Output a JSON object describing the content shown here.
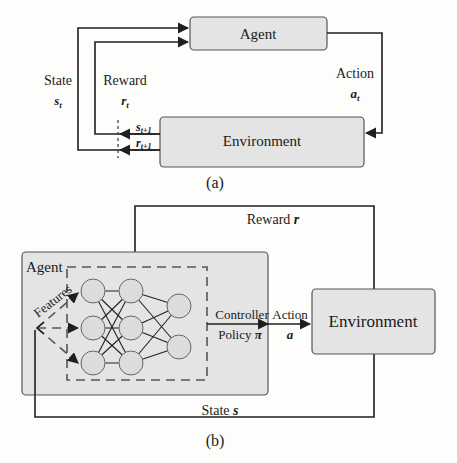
{
  "figure_a": {
    "caption": "(a)",
    "agent_box": {
      "label": "Agent"
    },
    "environment_box": {
      "label": "Environment"
    },
    "state_label": "State",
    "state_symbol": "s",
    "state_sub": "t",
    "reward_label": "Reward",
    "reward_symbol": "r",
    "reward_sub": "t",
    "action_label": "Action",
    "action_symbol": "a",
    "action_sub": "t",
    "next_state_symbol": "s",
    "next_state_sub": "t+1",
    "next_reward_symbol": "r",
    "next_reward_sub": "t+1"
  },
  "figure_b": {
    "caption": "(b)",
    "agent_label": "Agent",
    "environment_label": "Environment",
    "reward_label": "Reward",
    "reward_symbol": "r",
    "features_label": "Features",
    "controller_label": "Controller",
    "policy_label": "Policy",
    "policy_symbol": "π",
    "action_label": "Action",
    "action_symbol": "a",
    "state_label": "State",
    "state_symbol": "s",
    "network": {
      "layers": [
        3,
        3,
        2
      ]
    }
  },
  "colors": {
    "box_fill": "#e4e4e4",
    "box_stroke": "#555555",
    "line": "#1f1f1f",
    "node_fill": "#dcdcdc",
    "background": "#fdfdfb"
  }
}
